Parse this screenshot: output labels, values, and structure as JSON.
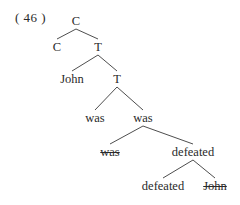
{
  "example_number": "( 46 )",
  "tree": {
    "nodes": [
      {
        "id": "n0",
        "label": "C",
        "x": 76,
        "y": 21,
        "strike": false
      },
      {
        "id": "n1",
        "label": "C",
        "x": 57,
        "y": 47,
        "strike": false
      },
      {
        "id": "n2",
        "label": "T",
        "x": 98,
        "y": 47,
        "strike": false
      },
      {
        "id": "n3",
        "label": "John",
        "x": 72,
        "y": 79,
        "strike": false
      },
      {
        "id": "n4",
        "label": "T",
        "x": 117,
        "y": 79,
        "strike": false
      },
      {
        "id": "n5",
        "label": "was",
        "x": 95,
        "y": 118,
        "strike": false
      },
      {
        "id": "n6",
        "label": "was",
        "x": 143,
        "y": 118,
        "strike": false
      },
      {
        "id": "n7",
        "label": "was",
        "x": 110,
        "y": 152,
        "strike": true
      },
      {
        "id": "n8",
        "label": "defeated",
        "x": 193,
        "y": 152,
        "strike": false
      },
      {
        "id": "n9",
        "label": "defeated",
        "x": 163,
        "y": 186,
        "strike": false
      },
      {
        "id": "n10",
        "label": "John",
        "x": 215,
        "y": 186,
        "strike": true
      }
    ],
    "edges": [
      [
        "n0",
        "n1"
      ],
      [
        "n0",
        "n2"
      ],
      [
        "n2",
        "n3"
      ],
      [
        "n2",
        "n4"
      ],
      [
        "n4",
        "n5"
      ],
      [
        "n4",
        "n6"
      ],
      [
        "n6",
        "n7"
      ],
      [
        "n6",
        "n8"
      ],
      [
        "n8",
        "n9"
      ],
      [
        "n8",
        "n10"
      ]
    ]
  }
}
